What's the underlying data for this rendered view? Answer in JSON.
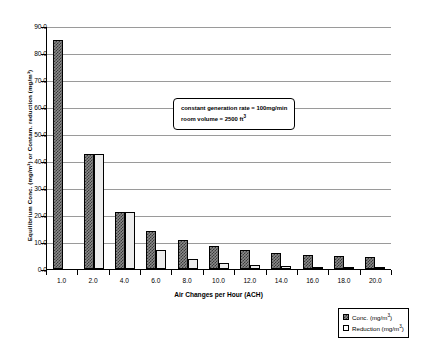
{
  "chart_data": {
    "type": "bar",
    "title": "",
    "xlabel": "Air Changes per Hour (ACH)",
    "ylabel": "Equilibrium Conc. (mg/m³) or Contam. reduction (mg/m³)",
    "categories": [
      "1.0",
      "2.0",
      "4.0",
      "6.0",
      "8.0",
      "10.0",
      "12.0",
      "14.0",
      "16.0",
      "18.0",
      "20.0"
    ],
    "series": [
      {
        "name": "Conc.  (mg/m³)",
        "values": [
          85.0,
          42.5,
          21.2,
          14.2,
          10.6,
          8.5,
          7.1,
          6.1,
          5.3,
          4.7,
          4.3
        ]
      },
      {
        "name": "Reduction  (mg/m³)",
        "values": [
          0.0,
          42.5,
          21.2,
          7.1,
          3.6,
          2.1,
          1.4,
          1.0,
          0.8,
          0.6,
          0.5
        ]
      }
    ],
    "ylim": [
      0.0,
      90.0
    ],
    "yticks": [
      "0.0",
      "10.0",
      "20.0",
      "30.0",
      "40.0",
      "50.0",
      "60.0",
      "70.0",
      "80.0",
      "90.0"
    ],
    "grid": true,
    "legend_position": "bottom-right",
    "annotations": [
      "constant generation rate = 100mg/min",
      "room volume = 2500 ft³"
    ]
  },
  "legend": {
    "entries": [
      {
        "label": "Conc.  (mg/m³)",
        "swatch": "conc-swatch"
      },
      {
        "label": "Reduction  (mg/m³)",
        "swatch": "reduction-swatch"
      }
    ]
  },
  "callout": {
    "line1": "constant generation rate = 100mg/min",
    "line2": "room volume = 2500 ft³"
  }
}
